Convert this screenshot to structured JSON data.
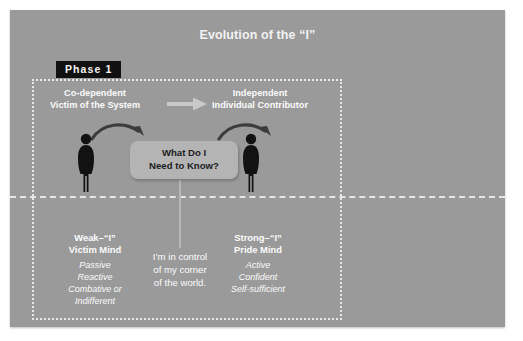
{
  "slide": {
    "title": "Evolution of the “I”",
    "phase_badge": "Phase 1",
    "background_color": "#9a9a9a",
    "badge_color": "#111111",
    "accent_text_color": "#fbfbfb"
  },
  "columns": {
    "left": {
      "head_line1": "Co-dependent",
      "head_line2": "Victim of the System",
      "mind_line1": "Weak–“I”",
      "mind_line2": "Victim Mind",
      "traits": [
        "Passive",
        "Reactive",
        "Combative or",
        "Indifferent"
      ]
    },
    "right": {
      "head_line1": "Independent",
      "head_line2": "Individual Contributor",
      "mind_line1": "Strong–“I”",
      "mind_line2": "Pride Mind",
      "traits": [
        "Active",
        "Confident",
        "Self-sufficient"
      ]
    }
  },
  "bubble": {
    "line1": "What Do I",
    "line2": "Need to Know?"
  },
  "center_note": {
    "line1": "I’m in control",
    "line2": "of my corner",
    "line3": "of the world."
  },
  "icons": {
    "transition_arrow": "arrow-right-icon",
    "curve_left": "curved-arrow-right-icon",
    "curve_right": "curved-arrow-right-icon",
    "person_left": "person-silhouette-icon",
    "person_right": "person-silhouette-icon"
  }
}
